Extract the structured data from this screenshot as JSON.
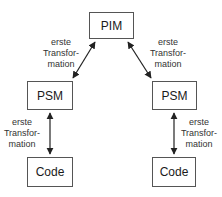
{
  "diagram": {
    "nodes": [
      {
        "id": "pim",
        "label": "PIM"
      },
      {
        "id": "psm_left",
        "label": "PSM"
      },
      {
        "id": "psm_right",
        "label": "PSM"
      },
      {
        "id": "code_left",
        "label": "Code"
      },
      {
        "id": "code_right",
        "label": "Code"
      }
    ],
    "edges": [
      {
        "from": "pim",
        "to": "psm_left",
        "label": [
          "erste",
          "Transfor-",
          "mation"
        ],
        "bidirectional": true
      },
      {
        "from": "pim",
        "to": "psm_right",
        "label": [
          "erste",
          "Transfor-",
          "mation"
        ],
        "bidirectional": true
      },
      {
        "from": "psm_left",
        "to": "code_left",
        "label": [
          "erste",
          "Transfor-",
          "mation"
        ],
        "bidirectional": true
      },
      {
        "from": "psm_right",
        "to": "code_right",
        "label": [
          "erste",
          "Transfor-",
          "mation"
        ],
        "bidirectional": true
      }
    ],
    "colors": {
      "stroke": "#555555",
      "arrow": "#222222",
      "text": "#1a1a1a"
    }
  }
}
